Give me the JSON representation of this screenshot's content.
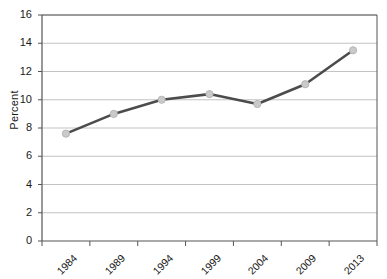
{
  "chart_data": {
    "type": "line",
    "title": "",
    "xlabel": "",
    "ylabel": "Percent",
    "categories": [
      "1984",
      "1989",
      "1994",
      "1999",
      "2004",
      "2009",
      "2013"
    ],
    "values": [
      7.6,
      9.0,
      10.0,
      10.4,
      9.7,
      11.1,
      13.5
    ],
    "series": [
      {
        "name": "Percent",
        "values": [
          7.6,
          9.0,
          10.0,
          10.4,
          9.7,
          11.1,
          13.5
        ]
      }
    ],
    "ylim": [
      0,
      16
    ],
    "yticks": [
      0,
      2,
      4,
      6,
      8,
      10,
      12,
      14,
      16
    ],
    "ytick_labels": [
      "0",
      "2",
      "4",
      "6",
      "8",
      "10",
      "12",
      "14",
      "16"
    ],
    "grid": "horizontal",
    "legend": "none",
    "marker": "circle",
    "xtick_label_rotation": -45
  },
  "style": {
    "line_color": "#4c4c4c",
    "marker_fill": "#cacaca",
    "marker_stroke": "#b6b6b6",
    "grid_color": "#a9a9a9",
    "axis_color": "#555555",
    "plot_background": "#ffffff",
    "text_color": "#1a1a1a"
  },
  "plot_geometry": {
    "left": 42,
    "right": 377,
    "top": 15,
    "bottom": 241
  }
}
